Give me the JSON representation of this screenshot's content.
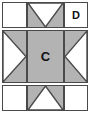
{
  "figure": {
    "name": "quilt-block-diagram",
    "width": 90,
    "height": 116,
    "background_color": "#ffffff",
    "fill_color": "#b3b3b3",
    "blank_color": "#ffffff",
    "line_color": "#4a4a4a"
  },
  "grid": {
    "rows": 3,
    "columns": 3,
    "cells": [
      {
        "id": "r1c1",
        "row": 1,
        "column": 1,
        "fill": "blank",
        "shape": "square",
        "label": ""
      },
      {
        "id": "r1c2",
        "row": 1,
        "column": 2,
        "fill": "shaded",
        "shape": "triangle-down",
        "label": ""
      },
      {
        "id": "r1c3",
        "row": 1,
        "column": 3,
        "fill": "blank",
        "shape": "square",
        "label": "D"
      },
      {
        "id": "r2c1",
        "row": 2,
        "column": 1,
        "fill": "shaded",
        "shape": "triangle-right",
        "label": ""
      },
      {
        "id": "r2c2",
        "row": 2,
        "column": 2,
        "fill": "shaded",
        "shape": "square",
        "label": "C"
      },
      {
        "id": "r2c3",
        "row": 2,
        "column": 3,
        "fill": "shaded",
        "shape": "triangle-left",
        "label": ""
      },
      {
        "id": "r3c1",
        "row": 3,
        "column": 1,
        "fill": "blank",
        "shape": "square",
        "label": ""
      },
      {
        "id": "r3c2",
        "row": 3,
        "column": 2,
        "fill": "shaded",
        "shape": "triangle-up",
        "label": ""
      },
      {
        "id": "r3c3",
        "row": 3,
        "column": 3,
        "fill": "blank",
        "shape": "square",
        "label": ""
      }
    ]
  },
  "labels": {
    "center": "C",
    "top_right": "D"
  }
}
